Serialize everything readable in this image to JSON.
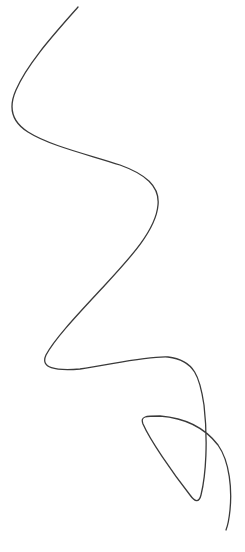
{
  "drawing": {
    "description": "Single continuous freehand curve",
    "stroke_color": "#3a3a3a",
    "background_color": "#ffffff"
  }
}
